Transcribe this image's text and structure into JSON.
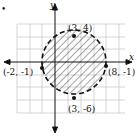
{
  "bullet": "•",
  "axes": {
    "x_label": "x",
    "y_label": "y"
  },
  "points": [
    {
      "label": "(3, 4)",
      "x": 3,
      "y": 4
    },
    {
      "label": "(-2, -1)",
      "x": -2,
      "y": -1
    },
    {
      "label": "(8, -1)",
      "x": 8,
      "y": -1
    },
    {
      "label": "(3, -6)",
      "x": 3,
      "y": -6
    }
  ],
  "circle": {
    "center": [
      3,
      -1
    ],
    "radius": 5,
    "style": "dashed",
    "fill": "hatched"
  }
}
